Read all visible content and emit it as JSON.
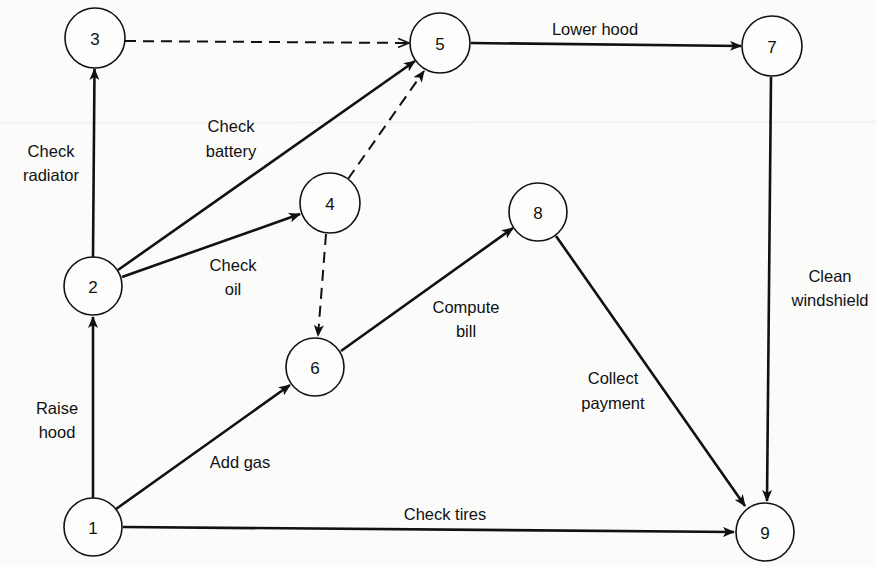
{
  "diagram": {
    "type": "activity-on-arrow network",
    "nodes": [
      {
        "id": "1",
        "label": "1",
        "x": 93,
        "y": 527
      },
      {
        "id": "2",
        "label": "2",
        "x": 93,
        "y": 286
      },
      {
        "id": "3",
        "label": "3",
        "x": 95,
        "y": 38
      },
      {
        "id": "4",
        "label": "4",
        "x": 330,
        "y": 203
      },
      {
        "id": "5",
        "label": "5",
        "x": 440,
        "y": 43
      },
      {
        "id": "6",
        "label": "6",
        "x": 315,
        "y": 367
      },
      {
        "id": "7",
        "label": "7",
        "x": 772,
        "y": 46
      },
      {
        "id": "8",
        "label": "8",
        "x": 538,
        "y": 212
      },
      {
        "id": "9",
        "label": "9",
        "x": 765,
        "y": 532
      }
    ],
    "edges": [
      {
        "from": "1",
        "to": "2",
        "label": [
          "Raise",
          "hood"
        ],
        "dashed": false
      },
      {
        "from": "2",
        "to": "3",
        "label": [
          "Check",
          "radiator"
        ],
        "dashed": false
      },
      {
        "from": "3",
        "to": "5",
        "label": [],
        "dashed": true
      },
      {
        "from": "2",
        "to": "5",
        "label": [
          "Check",
          "battery"
        ],
        "dashed": false
      },
      {
        "from": "2",
        "to": "4",
        "label": [
          "Check",
          "oil"
        ],
        "dashed": false
      },
      {
        "from": "4",
        "to": "5",
        "label": [],
        "dashed": true
      },
      {
        "from": "4",
        "to": "6",
        "label": [],
        "dashed": true
      },
      {
        "from": "1",
        "to": "6",
        "label": [
          "Add gas"
        ],
        "dashed": false
      },
      {
        "from": "6",
        "to": "8",
        "label": [
          "Compute",
          "bill"
        ],
        "dashed": false
      },
      {
        "from": "5",
        "to": "7",
        "label": [
          "Lower hood"
        ],
        "dashed": false
      },
      {
        "from": "7",
        "to": "9",
        "label": [
          "Clean",
          "windshield"
        ],
        "dashed": false
      },
      {
        "from": "8",
        "to": "9",
        "label": [
          "Collect",
          "payment"
        ],
        "dashed": false
      },
      {
        "from": "1",
        "to": "9",
        "label": [
          "Check tires"
        ],
        "dashed": false
      }
    ],
    "labels": {
      "raise_hood": [
        "Raise",
        "hood"
      ],
      "check_radiator": [
        "Check",
        "radiator"
      ],
      "check_battery": [
        "Check",
        "battery"
      ],
      "check_oil": [
        "Check",
        "oil"
      ],
      "add_gas": "Add gas",
      "compute_bill": [
        "Compute",
        "bill"
      ],
      "lower_hood": "Lower hood",
      "clean_windshield": [
        "Clean",
        "windshield"
      ],
      "collect_payment": [
        "Collect",
        "payment"
      ],
      "check_tires": "Check tires"
    }
  }
}
